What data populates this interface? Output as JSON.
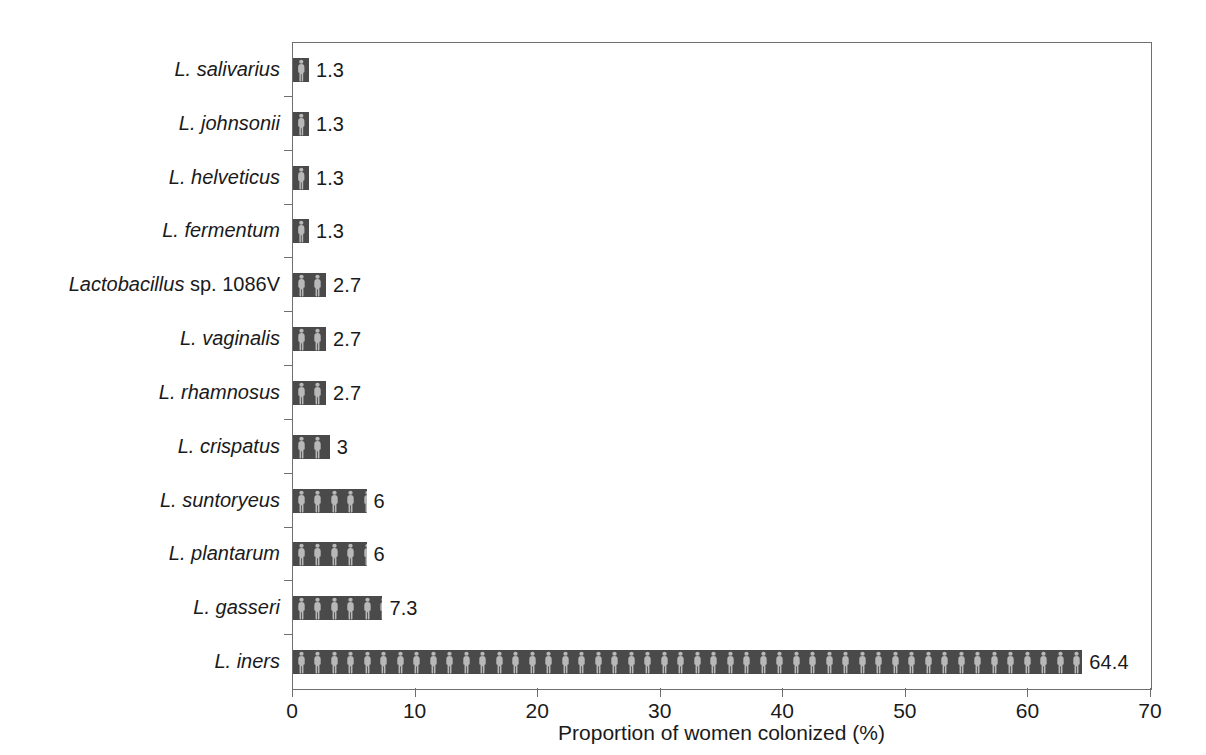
{
  "chart_data": {
    "type": "bar",
    "orientation": "horizontal",
    "title": "",
    "xlabel": "Proportion of women colonized (%)",
    "ylabel": "",
    "xlim": [
      0,
      70
    ],
    "xticks": [
      0,
      10,
      20,
      30,
      40,
      50,
      60,
      70
    ],
    "grid": false,
    "legend": null,
    "bar_fill": {
      "pattern": "person-pictogram",
      "background_color": "#4a4a4a",
      "figure_color": "#b8b8b8"
    },
    "categories": [
      "L. salivarius",
      "L. johnsonii",
      "L. helveticus",
      "L. fermentum",
      "Lactobacillus sp. 1086V",
      "L. vaginalis",
      "L. rhamnosus",
      "L. crispatus",
      "L. suntoryeus",
      "L. plantarum",
      "L. gasseri",
      "L. iners"
    ],
    "values": [
      1.3,
      1.3,
      1.3,
      1.3,
      2.7,
      2.7,
      2.7,
      3,
      6,
      6,
      7.3,
      64.4
    ],
    "data_labels": [
      "1.3",
      "1.3",
      "1.3",
      "1.3",
      "2.7",
      "2.7",
      "2.7",
      "3",
      "6",
      "6",
      "7.3",
      "64.4"
    ],
    "category_label_parts": [
      [
        {
          "text": "L. salivarius",
          "italic": true
        }
      ],
      [
        {
          "text": "L. johnsonii",
          "italic": true
        }
      ],
      [
        {
          "text": "L. helveticus",
          "italic": true
        }
      ],
      [
        {
          "text": "L. fermentum",
          "italic": true
        }
      ],
      [
        {
          "text": "Lactobacillus",
          "italic": true
        },
        {
          "text": " sp. 1086V",
          "italic": false
        }
      ],
      [
        {
          "text": "L. vaginalis",
          "italic": true
        }
      ],
      [
        {
          "text": "L. rhamnosus",
          "italic": true
        }
      ],
      [
        {
          "text": "L. crispatus",
          "italic": true
        }
      ],
      [
        {
          "text": "L. suntoryeus",
          "italic": true
        }
      ],
      [
        {
          "text": "L. plantarum",
          "italic": true
        }
      ],
      [
        {
          "text": "L. gasseri",
          "italic": true
        }
      ],
      [
        {
          "text": "L. iners",
          "italic": true
        }
      ]
    ]
  },
  "colors": {
    "bar_dark": "#4a4a4a",
    "bar_figure": "#b8b8b8",
    "axis": "#6f6f6f",
    "text": "#1a1a1a",
    "background": "#ffffff"
  }
}
